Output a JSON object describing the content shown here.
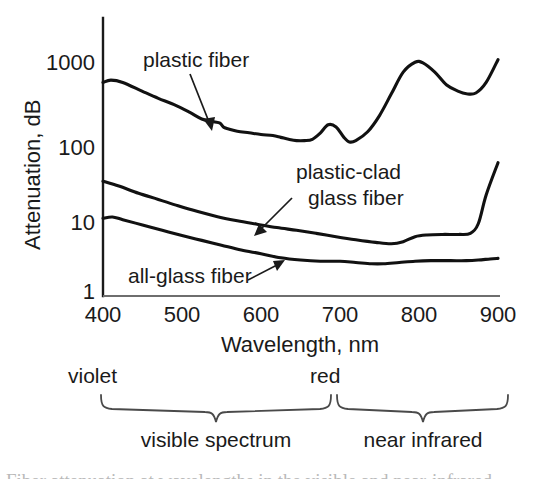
{
  "figure": {
    "title": "",
    "background_color": "#ffffff",
    "line_color": "#111111"
  },
  "chart_data": {
    "type": "line",
    "title": "",
    "subtitle": "",
    "xlabel": "Wavelength, nm",
    "ylabel": "Attenuation, dB",
    "xscale": "linear",
    "yscale": "log",
    "xlim": [
      400,
      900
    ],
    "ylim": [
      1,
      2000
    ],
    "grid": false,
    "legend_position": "inline-annotations",
    "xticks": [
      400,
      500,
      600,
      700,
      800,
      900
    ],
    "xtick_labels": [
      "400",
      "500",
      "600",
      "700",
      "800",
      "900"
    ],
    "yticks": [
      1,
      10,
      100,
      1000
    ],
    "ytick_labels": [
      "1",
      "10",
      "100",
      "1000"
    ],
    "series": [
      {
        "name": "plastic fiber",
        "label": "plastic fiber",
        "x": [
          400,
          410,
          425,
          450,
          470,
          490,
          510,
          525,
          540,
          548,
          553,
          560,
          570,
          585,
          600,
          615,
          625,
          635,
          645,
          655,
          665,
          675,
          685,
          695,
          705,
          712,
          720,
          735,
          750,
          765,
          780,
          795,
          805,
          820,
          835,
          850,
          860,
          872,
          885,
          900
        ],
        "y": [
          560,
          600,
          560,
          430,
          350,
          290,
          230,
          190,
          175,
          168,
          148,
          140,
          132,
          126,
          120,
          116,
          110,
          104,
          100,
          100,
          104,
          125,
          160,
          150,
          110,
          96,
          100,
          130,
          210,
          400,
          760,
          1020,
          1000,
          760,
          520,
          430,
          400,
          410,
          560,
          1100
        ]
      },
      {
        "name": "plastic-clad glass fiber",
        "label": "plastic-clad glass fiber",
        "x": [
          400,
          420,
          445,
          470,
          495,
          520,
          545,
          570,
          595,
          620,
          645,
          670,
          695,
          720,
          745,
          765,
          780,
          795,
          810,
          830,
          850,
          865,
          875,
          885,
          900
        ],
        "y": [
          30,
          26,
          21,
          17.5,
          14.5,
          12.2,
          10.5,
          9.3,
          8.4,
          7.6,
          7.0,
          6.4,
          5.8,
          5.3,
          4.9,
          4.7,
          5.0,
          5.8,
          6.1,
          6.2,
          6.2,
          6.4,
          8.5,
          20,
          52
        ]
      },
      {
        "name": "all-glass fiber",
        "label": "all-glass fiber",
        "x": [
          400,
          412,
          425,
          450,
          475,
          500,
          525,
          550,
          575,
          600,
          625,
          650,
          675,
          700,
          720,
          740,
          755,
          775,
          795,
          815,
          840,
          860,
          875,
          890,
          900
        ],
        "y": [
          10,
          10.4,
          9.6,
          8.2,
          7.0,
          6.0,
          5.2,
          4.5,
          3.9,
          3.5,
          3.1,
          2.9,
          2.8,
          2.8,
          2.7,
          2.6,
          2.6,
          2.7,
          2.8,
          2.85,
          2.85,
          2.85,
          2.9,
          3.0,
          3.05
        ]
      }
    ],
    "annotations": [
      {
        "text": "plastic fiber",
        "lines": [
          "plastic fiber"
        ],
        "label_x": 143,
        "label_y": 66,
        "arrow_from": [
          190,
          74
        ],
        "arrow_to": [
          212,
          128
        ]
      },
      {
        "text": "plastic-clad glass fiber",
        "lines": [
          "plastic-clad",
          "glass fiber"
        ],
        "label_x": 296,
        "label_y": 178,
        "arrow_from": [
          292,
          198
        ],
        "arrow_to": [
          256,
          233
        ]
      },
      {
        "text": "all-glass fiber",
        "lines": [
          "all-glass fiber"
        ],
        "label_x": 128,
        "label_y": 281,
        "arrow_from": [
          250,
          278
        ],
        "arrow_to": [
          282,
          262
        ]
      }
    ],
    "spectrum_bands": [
      {
        "label": "visible spectrum",
        "edge_labels": [
          "violet",
          "red"
        ],
        "start_nm": 400,
        "end_nm": 700
      },
      {
        "label": "near infrared",
        "edge_labels": [
          "red",
          ""
        ],
        "start_nm": 700,
        "end_nm": 900
      }
    ]
  },
  "axis": {
    "y_label": "Attenuation, dB",
    "x_label": "Wavelength, nm",
    "y_ticks": [
      "1000",
      "100",
      "10",
      "1"
    ],
    "x_ticks": [
      "400",
      "500",
      "600",
      "700",
      "800",
      "900"
    ]
  },
  "series_labels": {
    "plastic_fiber": "plastic fiber",
    "plastic_clad_line1": "plastic-clad",
    "plastic_clad_line2": "glass fiber",
    "all_glass": "all-glass fiber"
  },
  "spectrum": {
    "violet": "violet",
    "red": "red",
    "visible": "visible spectrum",
    "near_infrared": "near infrared"
  },
  "caption": {
    "cut_off_text": "Fiber attenuation at wavelengths in the visible and near-infrared"
  }
}
